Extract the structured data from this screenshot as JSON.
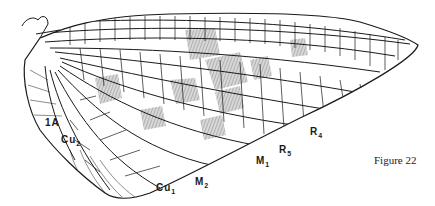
{
  "figure": {
    "caption": "Figure 22"
  },
  "vein_labels": [
    {
      "id": "1A",
      "base": "1A",
      "sub": ""
    },
    {
      "id": "Cu2",
      "base": "Cu",
      "sub": "2"
    },
    {
      "id": "Cu1",
      "base": "Cu",
      "sub": "1"
    },
    {
      "id": "M2",
      "base": "M",
      "sub": "2"
    },
    {
      "id": "M1",
      "base": "M",
      "sub": "1"
    },
    {
      "id": "R5",
      "base": "R",
      "sub": "5"
    },
    {
      "id": "R4",
      "base": "R",
      "sub": "4"
    }
  ],
  "colors": {
    "vein": "#1a1a1a",
    "shading": "#8a8a8a",
    "background": "#ffffff"
  }
}
